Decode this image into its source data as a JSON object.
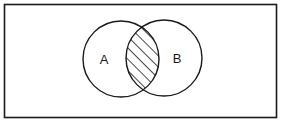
{
  "diagram": {
    "type": "venn",
    "universe": {
      "x": 4,
      "y": 4,
      "width": 272,
      "height": 113
    },
    "sets": [
      {
        "id": "A",
        "label": "A",
        "cx": 121,
        "cy": 59,
        "r": 38,
        "label_x": 104,
        "label_y": 61
      },
      {
        "id": "B",
        "label": "B",
        "cx": 164,
        "cy": 58,
        "r": 38,
        "label_x": 177,
        "label_y": 60
      }
    ],
    "shaded_region": "A ∩ B",
    "shading_pattern": "diagonal-hatch",
    "colors": {
      "stroke": "#1a1a1a",
      "background": "#ffffff"
    }
  }
}
